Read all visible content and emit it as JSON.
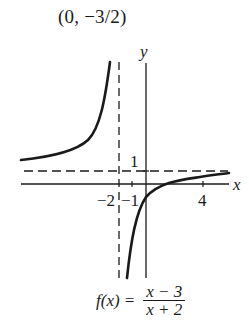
{
  "caption": "(0, −3/2)",
  "axes": {
    "x_label": "x",
    "y_label": "y",
    "ticks": {
      "x_neg2": "−2",
      "x_neg1": "−1",
      "x_4": "4",
      "y_1": "1"
    }
  },
  "function": {
    "lhs": "f(x) =",
    "numerator": "x − 3",
    "denominator": "x + 2"
  },
  "asymptotes": {
    "vertical": "x = -2",
    "horizontal": "y = 1"
  },
  "colors": {
    "ink": "#1a1a1a",
    "background": "#ffffff"
  }
}
